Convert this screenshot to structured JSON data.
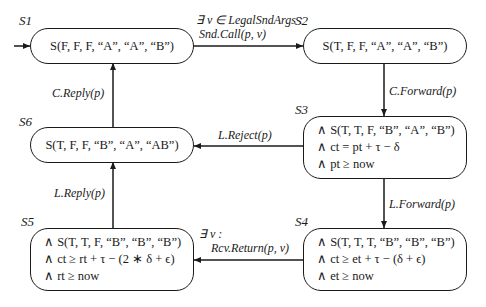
{
  "diagram": {
    "type": "state-machine",
    "states": [
      {
        "id": "S1",
        "label": "S1",
        "lines": [
          "S(F, F, F, “A”, “A”, “B”)"
        ],
        "initial": true
      },
      {
        "id": "S2",
        "label": "S2",
        "lines": [
          "S(T, F, F, “A”, “A”, “B”)"
        ]
      },
      {
        "id": "S3",
        "label": "S3",
        "lines": [
          "∧ S(T, T, F, “B”, “A”, “B”)",
          "∧ ct = pt + τ − δ",
          "∧ pt ≥ now"
        ]
      },
      {
        "id": "S4",
        "label": "S4",
        "lines": [
          "∧ S(T, T, T, “B”, “B”, “B”)",
          "∧ ct ≥ et + τ − (δ + ϵ)",
          "∧ et ≥ now"
        ]
      },
      {
        "id": "S5",
        "label": "S5",
        "lines": [
          "∧ S(T, T, F, “B”, “B”, “B”)",
          "∧ ct ≥ rt + τ − (2 ∗ δ + ϵ)",
          "∧ rt ≥ now"
        ]
      },
      {
        "id": "S6",
        "label": "S6",
        "lines": [
          "S(T, F, F, “B”, “A”, “AB”)"
        ]
      }
    ],
    "transitions": [
      {
        "from": "S1",
        "to": "S2",
        "label_line1": "∃ v ∈ LegalSndArgs :",
        "label_line2": "Snd.Call(p, v)"
      },
      {
        "from": "S2",
        "to": "S3",
        "label_line1": "C.Forward(p)"
      },
      {
        "from": "S3",
        "to": "S4",
        "label_line1": "L.Forward(p)"
      },
      {
        "from": "S3",
        "to": "S6",
        "label_line1": "L.Reject(p)"
      },
      {
        "from": "S4",
        "to": "S5",
        "label_line1": "∃ v :",
        "label_line2": "Rcv.Return(p, v)"
      },
      {
        "from": "S5",
        "to": "S6",
        "label_line1": "L.Reply(p)"
      },
      {
        "from": "S6",
        "to": "S1",
        "label_line1": "C.Reply(p)"
      }
    ]
  }
}
